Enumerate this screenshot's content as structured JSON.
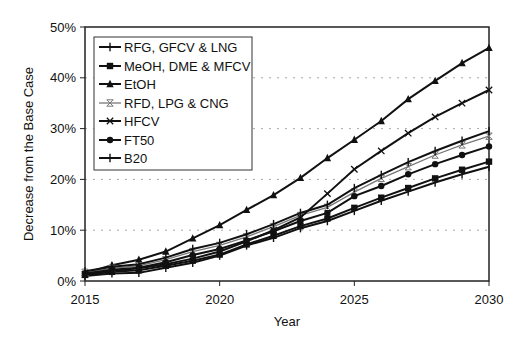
{
  "chart_data": {
    "type": "line",
    "title": "",
    "xlabel": "Year",
    "ylabel": "Decrease from the Base Case",
    "x": [
      2015,
      2016,
      2017,
      2018,
      2019,
      2020,
      2021,
      2022,
      2023,
      2024,
      2025,
      2026,
      2027,
      2028,
      2029,
      2030
    ],
    "x_ticks": [
      "2015",
      "2020",
      "2025",
      "2030"
    ],
    "y_ticks": [
      "0%",
      "10%",
      "20%",
      "30%",
      "40%",
      "50%"
    ],
    "ylim": [
      0,
      50
    ],
    "xlim": [
      2015,
      2030
    ],
    "grid": "horizontal dotted",
    "legend_position": "upper-left inside",
    "series": [
      {
        "name": "RFG, GFCV & LNG",
        "marker": "plus",
        "color": "#111111",
        "values": [
          1.0,
          1.5,
          1.6,
          2.6,
          3.6,
          5.0,
          7.0,
          8.5,
          10.4,
          11.8,
          13.8,
          15.8,
          17.6,
          19.4,
          21.0,
          22.5
        ]
      },
      {
        "name": "MeOH, DME & MFCV",
        "marker": "square",
        "color": "#111111",
        "values": [
          1.2,
          1.8,
          2.1,
          3.0,
          4.0,
          5.2,
          7.2,
          8.9,
          10.8,
          12.3,
          14.4,
          16.4,
          18.3,
          20.2,
          21.9,
          23.5
        ]
      },
      {
        "name": "EtOH",
        "marker": "triangle",
        "color": "#111111",
        "values": [
          1.6,
          3.1,
          4.2,
          5.8,
          8.4,
          11.0,
          14.0,
          16.9,
          20.3,
          24.2,
          27.8,
          31.5,
          35.8,
          39.4,
          42.9,
          45.9
        ]
      },
      {
        "name": "RFD, LPG & CNG",
        "marker": "x-bar",
        "color": "#777777",
        "values": [
          1.7,
          2.5,
          3.0,
          4.2,
          5.8,
          7.0,
          8.7,
          10.7,
          12.9,
          14.5,
          17.5,
          20.2,
          22.5,
          24.8,
          26.8,
          28.5
        ]
      },
      {
        "name": "HFCV",
        "marker": "x",
        "color": "#111111",
        "values": [
          1.3,
          2.0,
          2.5,
          3.3,
          4.4,
          5.8,
          7.8,
          10.0,
          12.5,
          17.2,
          22.0,
          25.6,
          29.1,
          32.3,
          35.0,
          37.6
        ]
      },
      {
        "name": "FT50",
        "marker": "circle",
        "color": "#111111",
        "values": [
          1.5,
          2.2,
          2.6,
          3.7,
          5.1,
          6.3,
          8.0,
          9.8,
          11.8,
          13.4,
          16.7,
          18.7,
          21.0,
          23.0,
          24.8,
          26.5
        ]
      },
      {
        "name": "B20",
        "marker": "plus",
        "color": "#111111",
        "values": [
          1.9,
          2.8,
          3.3,
          4.6,
          6.3,
          7.5,
          9.2,
          11.2,
          13.4,
          15.0,
          18.3,
          20.9,
          23.4,
          25.6,
          27.6,
          29.5
        ]
      }
    ]
  }
}
